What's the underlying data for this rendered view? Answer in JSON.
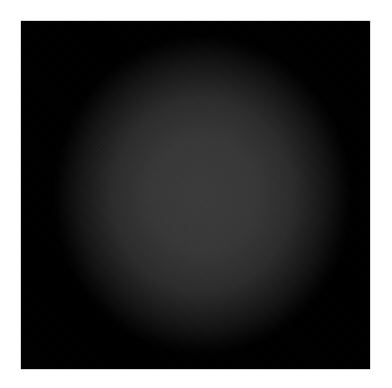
{
  "image": {
    "description": "Black square with a soft centered gray radial glow on white background",
    "colors": {
      "background": "#ffffff",
      "square": "#000000",
      "glow_center": "#3b3b3b"
    }
  }
}
